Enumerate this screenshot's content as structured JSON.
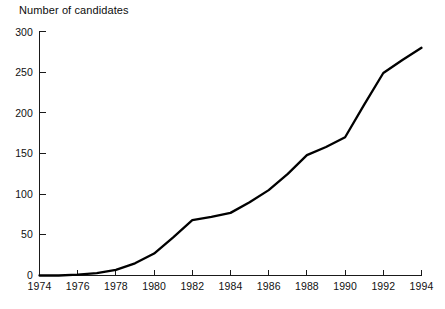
{
  "chart_data": {
    "type": "line",
    "title": "",
    "ylabel": "Number of candidates",
    "xlabel": "",
    "x": [
      1974,
      1975,
      1976,
      1977,
      1978,
      1979,
      1980,
      1981,
      1982,
      1983,
      1984,
      1985,
      1986,
      1987,
      1988,
      1989,
      1990,
      1991,
      1992,
      1993,
      1994
    ],
    "values": [
      0,
      0,
      1,
      3,
      7,
      15,
      27,
      47,
      68,
      72,
      77,
      90,
      105,
      125,
      148,
      158,
      170,
      210,
      249,
      265,
      280
    ],
    "series": [
      {
        "name": "Number of candidates",
        "values": [
          0,
          0,
          1,
          3,
          7,
          15,
          27,
          47,
          68,
          72,
          77,
          90,
          105,
          125,
          148,
          158,
          170,
          210,
          249,
          265,
          280
        ]
      }
    ],
    "xlim": [
      1974,
      1994
    ],
    "ylim": [
      0,
      300
    ],
    "y_ticks": [
      0,
      50,
      100,
      150,
      200,
      250,
      300
    ],
    "y_tick_labels": [
      "0",
      "50",
      "100",
      "150",
      "200",
      "250",
      "300"
    ],
    "x_ticks": [
      1974,
      1976,
      1978,
      1980,
      1982,
      1984,
      1986,
      1988,
      1990,
      1992,
      1994
    ],
    "x_tick_labels": [
      "1974",
      "1976",
      "1978",
      "1980",
      "1982",
      "1984",
      "1986",
      "1988",
      "1990",
      "1992",
      "1994"
    ],
    "grid": false,
    "legend": false,
    "legend_position": "none",
    "line_color": "#000000",
    "axis_color": "#1a1a1a",
    "background_color": "#ffffff"
  },
  "axis_title": {
    "text": "Number of candidates"
  }
}
